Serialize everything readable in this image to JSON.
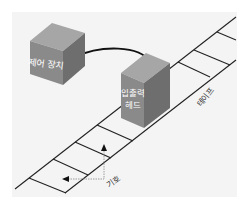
{
  "diagram": {
    "labels": {
      "control_unit": "제어 장치",
      "head_line1": "입출력",
      "head_line2": "헤드",
      "tape": "테이프",
      "symbol": "기호"
    },
    "colors": {
      "background": "#f4f4f4",
      "cube_front": "#8a8a8a",
      "cube_top": "#a6a6a6",
      "cube_side": "#6e6e6e",
      "line": "#222222",
      "label_on_cube": "#ffffff",
      "annotation": "#333333"
    },
    "tape_cells": 7
  }
}
